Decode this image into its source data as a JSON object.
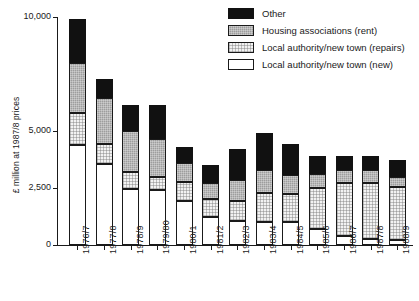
{
  "chart_data": {
    "type": "bar",
    "stacked": true,
    "title": "",
    "subtitle": "",
    "xlabel": "",
    "ylabel": "£ million at 1987/8 prices",
    "ylim": [
      0,
      10000
    ],
    "yticks": [
      0,
      2500,
      5000,
      10000
    ],
    "ytick_labels": [
      "0",
      "2,500",
      "5,000",
      "10,000"
    ],
    "grid": false,
    "legend_position": "top-right",
    "categories": [
      "1976/7",
      "1977/8",
      "1978/9",
      "1979/80",
      "1980/1",
      "1981/2",
      "1982/3",
      "1983/4",
      "1984/5",
      "1985/6",
      "1986/7",
      "1987/8",
      "1988/9"
    ],
    "series": [
      {
        "name": "Local authority/new town (new)",
        "key": "newbuild",
        "color": "#ffffff",
        "values": [
          4400,
          3550,
          2450,
          2400,
          1950,
          1250,
          1050,
          1000,
          1000,
          700,
          400,
          250,
          200
        ]
      },
      {
        "name": "Local authority/new town (repairs)",
        "key": "repairs",
        "color": "#f2f2f2",
        "values": [
          1400,
          900,
          750,
          600,
          800,
          750,
          900,
          1300,
          1250,
          1800,
          2300,
          2450,
          2350
        ]
      },
      {
        "name": "Housing associations (rent)",
        "key": "ha",
        "color": "#9d9d9d",
        "values": [
          2200,
          2000,
          1800,
          1650,
          850,
          700,
          900,
          1000,
          800,
          600,
          600,
          600,
          450
        ]
      },
      {
        "name": "Other",
        "key": "other",
        "color": "#111111",
        "values": [
          1900,
          850,
          1150,
          1500,
          700,
          800,
          1350,
          1600,
          1400,
          800,
          600,
          600,
          750
        ]
      }
    ],
    "totals": [
      9900,
      7300,
      6150,
      6150,
      4300,
      3500,
      4200,
      4900,
      4450,
      3900,
      3900,
      3900,
      3750
    ]
  },
  "legend": {
    "items": [
      {
        "label": "Other",
        "key": "other"
      },
      {
        "label": "Housing associations (rent)",
        "key": "ha"
      },
      {
        "label": "Local authority/new town (repairs)",
        "key": "repairs"
      },
      {
        "label": "Local authority/new town (new)",
        "key": "newbuild"
      }
    ]
  }
}
